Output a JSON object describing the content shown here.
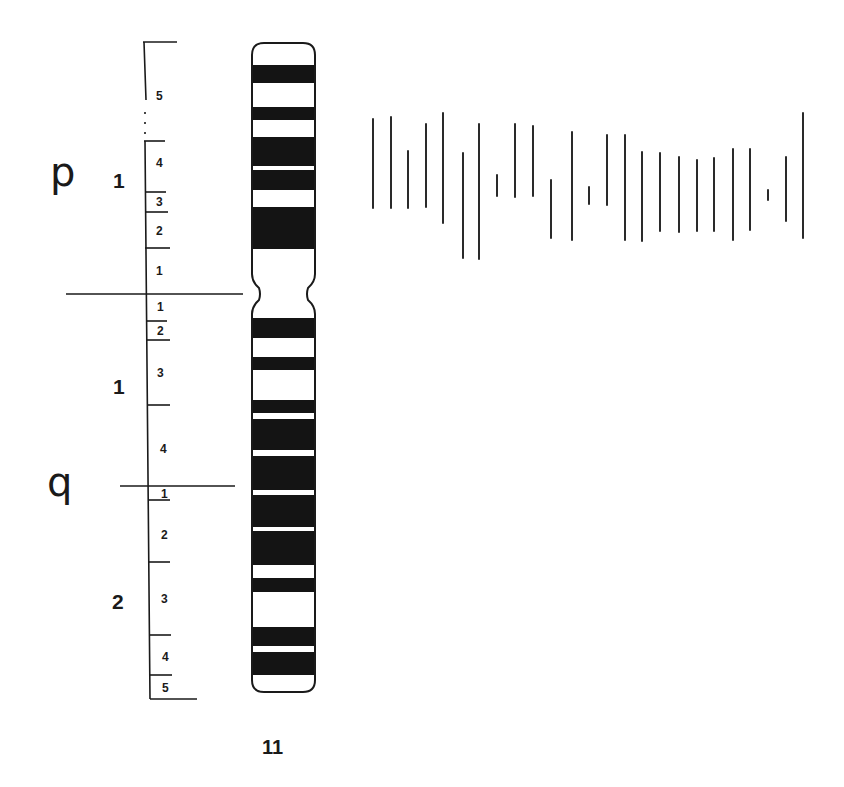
{
  "diagram": {
    "type": "chromosome-ideogram",
    "chromosome": {
      "label": "11"
    },
    "colors": {
      "ink": "#1a1a1a",
      "background": "#ffffff",
      "band_dark": "#141414",
      "band_light": "#ffffff"
    },
    "arms": [
      {
        "letter": "p",
        "x": 50,
        "y": 152
      },
      {
        "letter": "q",
        "x": 47,
        "y": 462
      }
    ],
    "regions": [
      {
        "arm": "p",
        "label": "1",
        "x": 113,
        "y": 170
      },
      {
        "arm": "q",
        "label": "1",
        "x": 113,
        "y": 376
      },
      {
        "arm": "q",
        "label": "2",
        "x": 112,
        "y": 591
      }
    ],
    "band_labels": [
      {
        "arm": "p",
        "region": "1",
        "band": "5",
        "x": 156,
        "y": 90
      },
      {
        "arm": "p",
        "region": "1",
        "band": "4",
        "x": 156,
        "y": 157
      },
      {
        "arm": "p",
        "region": "1",
        "band": "3",
        "x": 156,
        "y": 196
      },
      {
        "arm": "p",
        "region": "1",
        "band": "2",
        "x": 156,
        "y": 225
      },
      {
        "arm": "p",
        "region": "1",
        "band": "1",
        "x": 156,
        "y": 265
      },
      {
        "arm": "q",
        "region": "1",
        "band": "1",
        "x": 157,
        "y": 301
      },
      {
        "arm": "q",
        "region": "1",
        "band": "2",
        "x": 157,
        "y": 325
      },
      {
        "arm": "q",
        "region": "1",
        "band": "3",
        "x": 157,
        "y": 367
      },
      {
        "arm": "q",
        "region": "1",
        "band": "4",
        "x": 160,
        "y": 443
      },
      {
        "arm": "q",
        "region": "2",
        "band": "1",
        "x": 161,
        "y": 488
      },
      {
        "arm": "q",
        "region": "2",
        "band": "2",
        "x": 161,
        "y": 529
      },
      {
        "arm": "q",
        "region": "2",
        "band": "3",
        "x": 161,
        "y": 593
      },
      {
        "arm": "q",
        "region": "2",
        "band": "4",
        "x": 162,
        "y": 651
      },
      {
        "arm": "q",
        "region": "2",
        "band": "5",
        "x": 162,
        "y": 682
      }
    ],
    "ruler": {
      "spine": {
        "x": 144,
        "y_top": 42,
        "y_bottom": 699
      },
      "ticks": [
        {
          "y": 42,
          "x1": 143,
          "x2": 177
        },
        {
          "y": 141,
          "x1": 144,
          "x2": 165
        },
        {
          "y": 192,
          "x1": 145,
          "x2": 166
        },
        {
          "y": 212,
          "x1": 145,
          "x2": 168
        },
        {
          "y": 248,
          "x1": 145,
          "x2": 170
        },
        {
          "y": 321,
          "x1": 147,
          "x2": 167
        },
        {
          "y": 340,
          "x1": 147,
          "x2": 170
        },
        {
          "y": 405,
          "x1": 148,
          "x2": 170
        },
        {
          "y": 500,
          "x1": 148,
          "x2": 170
        },
        {
          "y": 562,
          "x1": 149,
          "x2": 170
        },
        {
          "y": 635,
          "x1": 150,
          "x2": 171
        },
        {
          "y": 675,
          "x1": 150,
          "x2": 172
        },
        {
          "y": 699,
          "x1": 150,
          "x2": 197
        }
      ],
      "dividers": [
        {
          "name": "centromere-divider",
          "y": 294,
          "x1": 66,
          "x2": 243
        },
        {
          "name": "region-q1-q2-divider",
          "y": 486,
          "x1": 120,
          "x2": 235
        }
      ]
    },
    "ideogram": {
      "x_left": 252,
      "x_right": 315,
      "y_top": 43,
      "y_bottom": 692,
      "centromere_y": 294,
      "centromere_waist": 9,
      "dark_bands": [
        [
          65,
          83
        ],
        [
          107,
          120
        ],
        [
          137,
          166
        ],
        [
          170,
          190
        ],
        [
          207,
          249
        ],
        [
          318,
          338
        ],
        [
          357,
          370
        ],
        [
          400,
          413
        ],
        [
          419,
          450
        ],
        [
          456,
          490
        ],
        [
          495,
          527
        ],
        [
          531,
          565
        ],
        [
          578,
          592
        ],
        [
          627,
          646
        ],
        [
          652,
          675
        ]
      ]
    },
    "marker_lines": [
      {
        "x": 373,
        "y1": 119,
        "y2": 208
      },
      {
        "x": 391,
        "y1": 117,
        "y2": 208
      },
      {
        "x": 408,
        "y1": 151,
        "y2": 208
      },
      {
        "x": 426,
        "y1": 124,
        "y2": 207
      },
      {
        "x": 443,
        "y1": 113,
        "y2": 223
      },
      {
        "x": 463,
        "y1": 153,
        "y2": 258
      },
      {
        "x": 479,
        "y1": 124,
        "y2": 259
      },
      {
        "x": 497,
        "y1": 175,
        "y2": 196
      },
      {
        "x": 515,
        "y1": 124,
        "y2": 197
      },
      {
        "x": 533,
        "y1": 126,
        "y2": 196
      },
      {
        "x": 551,
        "y1": 180,
        "y2": 238
      },
      {
        "x": 572,
        "y1": 132,
        "y2": 240
      },
      {
        "x": 589,
        "y1": 187,
        "y2": 204
      },
      {
        "x": 607,
        "y1": 135,
        "y2": 205
      },
      {
        "x": 625,
        "y1": 135,
        "y2": 240
      },
      {
        "x": 642,
        "y1": 152,
        "y2": 241
      },
      {
        "x": 660,
        "y1": 153,
        "y2": 231
      },
      {
        "x": 679,
        "y1": 157,
        "y2": 232
      },
      {
        "x": 697,
        "y1": 160,
        "y2": 231
      },
      {
        "x": 714,
        "y1": 158,
        "y2": 231
      },
      {
        "x": 733,
        "y1": 149,
        "y2": 240
      },
      {
        "x": 750,
        "y1": 149,
        "y2": 230
      },
      {
        "x": 768,
        "y1": 190,
        "y2": 200
      },
      {
        "x": 786,
        "y1": 157,
        "y2": 221
      },
      {
        "x": 803,
        "y1": 113,
        "y2": 238
      }
    ],
    "chromosome_label_pos": {
      "x": 262,
      "y": 737
    }
  }
}
